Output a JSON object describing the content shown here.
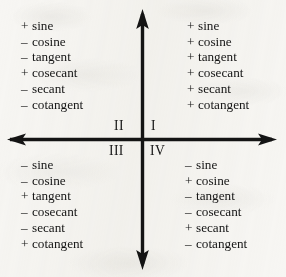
{
  "figure": {
    "background_color": "#f7f6f3",
    "ink_color": "#141414"
  },
  "axes": {
    "origin_x": 142,
    "origin_y": 139,
    "x_axis_label": "horizontal-axis",
    "y_axis_label": "vertical-axis",
    "arrow_directions": [
      "up",
      "down",
      "left",
      "right"
    ]
  },
  "quadrants": [
    {
      "numeral": "I",
      "position": "upper-right",
      "entries": [
        {
          "sign": "+",
          "function": "sine"
        },
        {
          "sign": "+",
          "function": "cosine"
        },
        {
          "sign": "+",
          "function": "tangent"
        },
        {
          "sign": "+",
          "function": "cosecant"
        },
        {
          "sign": "+",
          "function": "secant"
        },
        {
          "sign": "+",
          "function": "cotangent"
        }
      ]
    },
    {
      "numeral": "II",
      "position": "upper-left",
      "entries": [
        {
          "sign": "+",
          "function": "sine"
        },
        {
          "sign": "–",
          "function": "cosine"
        },
        {
          "sign": "–",
          "function": "tangent"
        },
        {
          "sign": "+",
          "function": "cosecant"
        },
        {
          "sign": "–",
          "function": "secant"
        },
        {
          "sign": "–",
          "function": "cotangent"
        }
      ]
    },
    {
      "numeral": "III",
      "position": "lower-left",
      "entries": [
        {
          "sign": "–",
          "function": "sine"
        },
        {
          "sign": "–",
          "function": "cosine"
        },
        {
          "sign": "+",
          "function": "tangent"
        },
        {
          "sign": "–",
          "function": "cosecant"
        },
        {
          "sign": "–",
          "function": "secant"
        },
        {
          "sign": "+",
          "function": "cotangent"
        }
      ]
    },
    {
      "numeral": "IV",
      "position": "lower-right",
      "entries": [
        {
          "sign": "–",
          "function": "sine"
        },
        {
          "sign": "+",
          "function": "cosine"
        },
        {
          "sign": "–",
          "function": "tangent"
        },
        {
          "sign": "–",
          "function": "cosecant"
        },
        {
          "sign": "+",
          "function": "secant"
        },
        {
          "sign": "–",
          "function": "cotangent"
        }
      ]
    }
  ]
}
